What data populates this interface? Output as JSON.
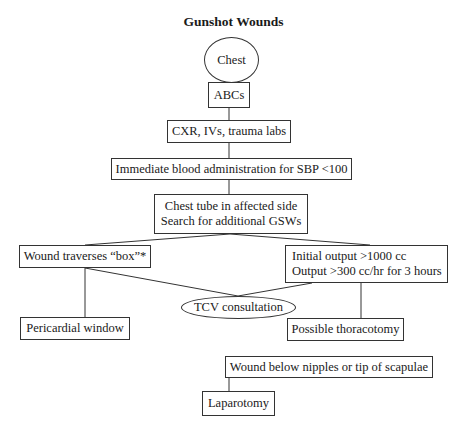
{
  "title": "Gunshot Wounds",
  "nodes": {
    "chest": "Chest",
    "abcs": "ABCs",
    "cxr": "CXR, IVs, trauma labs",
    "blood": "Immediate blood administration for SBP <100",
    "chest_tube": [
      "Chest tube in affected side",
      "Search for additional GSWs"
    ],
    "wound_box": "Wound traverses “box”*",
    "initial_output": [
      "Initial output >1000 cc",
      "Output >300 cc/hr for 3 hours"
    ],
    "tcv": "TCV consultation",
    "pericardial": "Pericardial window",
    "thoracotomy": "Possible thoracotomy",
    "wound_below": "Wound below nipples or tip of scapulae",
    "laparotomy": "Laparotomy"
  }
}
